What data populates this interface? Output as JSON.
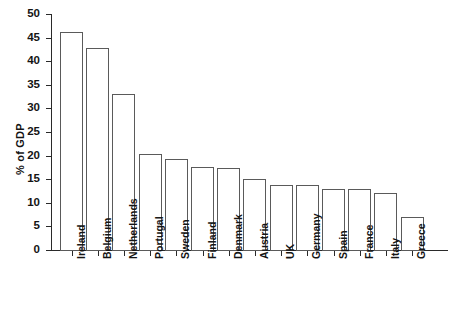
{
  "chart_data": {
    "type": "bar",
    "title": "",
    "subtitle": "",
    "xlabel": "",
    "ylabel": "% of GDP",
    "ylim": [
      0,
      50
    ],
    "ytick_step": 5,
    "yticks": [
      0,
      5,
      10,
      15,
      20,
      25,
      30,
      35,
      40,
      45,
      50
    ],
    "ytick_labels": [
      "0",
      "5",
      "10",
      "15",
      "20",
      "25",
      "30",
      "35",
      "40",
      "45",
      "50"
    ],
    "grid": false,
    "legend": null,
    "legend_position": "none",
    "categories": [
      "Ireland",
      "Belgium",
      "Netherlands",
      "Portugal",
      "Sweden",
      "Finland",
      "Denmark",
      "Austria",
      "UK",
      "Germany",
      "Spain",
      "France",
      "Italy",
      "Greece"
    ],
    "values": [
      46.2,
      42.8,
      33.1,
      20.3,
      19.2,
      17.6,
      17.4,
      15.1,
      13.8,
      13.8,
      13.0,
      12.9,
      12.1,
      7.0
    ],
    "bar_style": {
      "fill": "#ffffff",
      "edge": "#5a5a5a",
      "edge_width": 1
    },
    "axis_color": "#2a2a2a"
  }
}
